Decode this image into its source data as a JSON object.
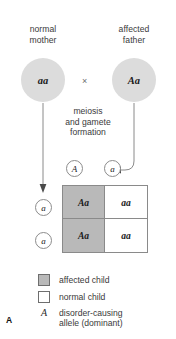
{
  "figure": {
    "panel_label": "A",
    "type": "punnett-square-autosomal-dominant-inheritance"
  },
  "parents": {
    "mother": {
      "label_line1": "normal",
      "label_line2": "mother",
      "genotype": "aa",
      "circle_color": "#dcdcdc"
    },
    "father": {
      "label_line1": "affected",
      "label_line2": "father",
      "genotype": "Aa",
      "circle_color": "#dcdcdc"
    },
    "cross_symbol": "×"
  },
  "meiosis": {
    "line1": "meiosis",
    "line2": "and gamete",
    "line3": "formation"
  },
  "gametes": {
    "father": [
      {
        "allele": "A"
      },
      {
        "allele": "a"
      }
    ],
    "mother": [
      {
        "allele": "a"
      },
      {
        "allele": "a"
      }
    ]
  },
  "punnett": {
    "columns": [
      "A",
      "a"
    ],
    "rows": [
      "a",
      "a"
    ],
    "cells": [
      {
        "genotype": "Aa",
        "status": "affected"
      },
      {
        "genotype": "aa",
        "status": "normal"
      },
      {
        "genotype": "Aa",
        "status": "affected"
      },
      {
        "genotype": "aa",
        "status": "normal"
      }
    ],
    "affected_color": "#b9b9b9",
    "normal_color": "#ffffff",
    "border_color": "#8a8a8a"
  },
  "legend": {
    "items": [
      {
        "swatch": "affected",
        "label": "affected child"
      },
      {
        "swatch": "normal",
        "label": "normal child"
      }
    ],
    "allele_note": {
      "symbol": "A",
      "line1": "disorder-causing",
      "line2": "allele (dominant)"
    }
  }
}
